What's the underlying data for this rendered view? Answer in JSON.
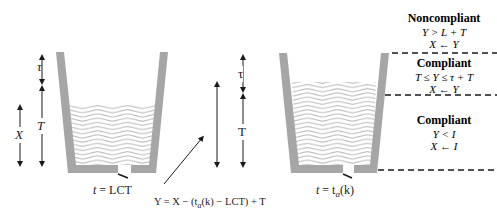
{
  "diagram": {
    "left_bucket": {
      "caption_var": "t",
      "caption_eq": " = LCT",
      "labels": {
        "tau": "τ",
        "T": "T",
        "X": "X"
      }
    },
    "right_bucket": {
      "caption_var": "t",
      "caption_eq": " = t",
      "caption_sub": "a",
      "caption_tail": "(k)",
      "labels": {
        "tau": "τ",
        "T": "T"
      }
    },
    "formula": {
      "text": "Y = X − (t",
      "sub": "a",
      "tail": "(k) − LCT) + T"
    },
    "zones": [
      {
        "title": "Noncompliant",
        "condition": "Y > L + T",
        "update": "X ← Y"
      },
      {
        "title": "Compliant",
        "condition": "T ≤ Y ≤ τ + T",
        "update": "X ← Y"
      },
      {
        "title": "Compliant",
        "condition": "Y < I",
        "update": "X ← I"
      }
    ],
    "colors": {
      "bucket_wall": "#a6a6a6",
      "water_line": "#bdbdbd",
      "arrow": "#1a1a1a",
      "dashed": "#1a1a1a"
    }
  }
}
